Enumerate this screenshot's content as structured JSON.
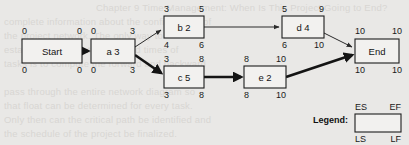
{
  "diagram": {
    "type": "pert-cpm-network",
    "nodes": [
      {
        "id": "start",
        "label": "Start",
        "es": "0",
        "ef": "0",
        "ls": "0",
        "lf": "0",
        "x": 22,
        "y": 39,
        "w": 60,
        "h": 24
      },
      {
        "id": "a",
        "label": "a 3",
        "es": "0",
        "ef": "3",
        "ls": "0",
        "lf": "3",
        "x": 91,
        "y": 39,
        "w": 44,
        "h": 24
      },
      {
        "id": "b",
        "label": "b 2",
        "es": "3",
        "ef": "5",
        "ls": "4",
        "lf": "6",
        "x": 164,
        "y": 16,
        "w": 40,
        "h": 22
      },
      {
        "id": "c",
        "label": "c 5",
        "es": "3",
        "ef": "8",
        "ls": "3",
        "lf": "8",
        "x": 164,
        "y": 66,
        "w": 40,
        "h": 22
      },
      {
        "id": "d",
        "label": "d 4",
        "es": "5",
        "ef": "9",
        "ls": "6",
        "lf": "10",
        "x": 282,
        "y": 16,
        "w": 42,
        "h": 22
      },
      {
        "id": "e",
        "label": "e 2",
        "es": "8",
        "ef": "10",
        "ls": "8",
        "lf": "10",
        "x": 244,
        "y": 66,
        "w": 42,
        "h": 22
      },
      {
        "id": "end",
        "label": "End",
        "es": "10",
        "ef": "10",
        "ls": "10",
        "lf": "10",
        "x": 355,
        "y": 39,
        "w": 44,
        "h": 24
      }
    ],
    "edges": [
      {
        "id": "start-a",
        "from": "start",
        "to": "a",
        "critical": true
      },
      {
        "id": "a-b",
        "from": "a",
        "to": "b",
        "critical": false
      },
      {
        "id": "a-c",
        "from": "a",
        "to": "c",
        "critical": true
      },
      {
        "id": "b-d",
        "from": "b",
        "to": "d",
        "critical": false
      },
      {
        "id": "c-e",
        "from": "c",
        "to": "e",
        "critical": true
      },
      {
        "id": "d-end",
        "from": "d",
        "to": "end",
        "critical": false
      },
      {
        "id": "e-end",
        "from": "e",
        "to": "end",
        "critical": true
      }
    ]
  },
  "legend": {
    "title": "Legend:",
    "es": "ES",
    "ef": "EF",
    "ls": "LS",
    "lf": "LF"
  },
  "background_bleed": [
    "Chapter 9 Time Management: When Is This Project Going to End?",
    "complete information about the configuration of",
    "the project network. The only way to",
    "establish the true start and end times of",
    "tasks is to compute the forward and backward",
    "pass through the entire network diagram so",
    "that float can be determined for every task.",
    "Only then can the critical path be identified and",
    "the schedule of the project be finalized."
  ],
  "colors": {
    "paper": "#e9e8e6",
    "ink": "#141414",
    "node_fill": "#f2f1ef",
    "bleed_text": "#d8d6d3"
  }
}
